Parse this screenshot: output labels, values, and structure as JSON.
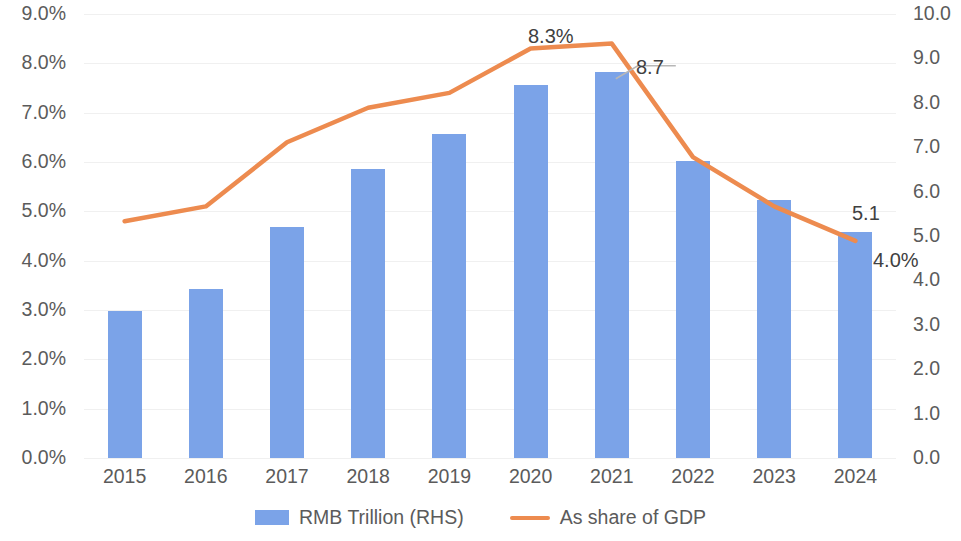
{
  "chart_data": {
    "type": "bar",
    "title": "",
    "xlabel": "",
    "categories": [
      "2015",
      "2016",
      "2017",
      "2018",
      "2019",
      "2020",
      "2021",
      "2022",
      "2023",
      "2024"
    ],
    "series": [
      {
        "name": "RMB Trillion (RHS)",
        "type": "bar",
        "axis": "right",
        "color": "#7BA3E8",
        "values": [
          3.3,
          3.8,
          5.2,
          6.5,
          7.3,
          8.4,
          8.7,
          6.7,
          5.8,
          5.1
        ]
      },
      {
        "name": "As share of GDP",
        "type": "line",
        "axis": "left",
        "color": "#ED8B4F",
        "values": [
          4.8,
          5.1,
          6.4,
          7.1,
          7.4,
          8.3,
          8.4,
          6.1,
          5.1,
          4.4
        ]
      }
    ],
    "left_axis": {
      "label": "",
      "ticks": [
        "0.0%",
        "1.0%",
        "2.0%",
        "3.0%",
        "4.0%",
        "5.0%",
        "6.0%",
        "7.0%",
        "8.0%",
        "9.0%"
      ],
      "values": [
        0,
        1,
        2,
        3,
        4,
        5,
        6,
        7,
        8,
        9
      ],
      "ylim": [
        0,
        9
      ]
    },
    "right_axis": {
      "label": "",
      "ticks": [
        "0.0",
        "1.0",
        "2.0",
        "3.0",
        "4.0",
        "5.0",
        "6.0",
        "7.0",
        "8.0",
        "9.0",
        "10.0"
      ],
      "values": [
        0,
        1,
        2,
        3,
        4,
        5,
        6,
        7,
        8,
        9,
        10
      ],
      "ylim": [
        0,
        10
      ]
    },
    "grid": true,
    "legend_position": "bottom",
    "annotations": [
      {
        "id": "peak-share",
        "text": "8.3%",
        "category": "2020",
        "series": "As share of GDP",
        "x_pct": 58.5,
        "y_pct": 4.6,
        "leader": false
      },
      {
        "id": "bar-2021",
        "text": "8.7",
        "category": "2021",
        "series": "RMB Trillion (RHS)",
        "x_pct": 75.5,
        "y_pct": 10.5,
        "leader": true
      },
      {
        "id": "bar-2024",
        "text": "5.1",
        "category": "2024",
        "series": "RMB Trillion (RHS)",
        "x_pct": 91.0,
        "y_pct": 46.0,
        "leader": false
      },
      {
        "id": "end-share",
        "text": "4.0%",
        "category": "2024",
        "series": "As share of GDP",
        "x_pct": 96.5,
        "y_pct": 54.0,
        "leader": false
      }
    ]
  },
  "legend": {
    "items": [
      {
        "label": "RMB Trillion (RHS)",
        "marker": "bar-swatch",
        "color": "#7BA3E8"
      },
      {
        "label": "As share of GDP",
        "marker": "line-swatch",
        "color": "#ED8B4F"
      }
    ]
  }
}
